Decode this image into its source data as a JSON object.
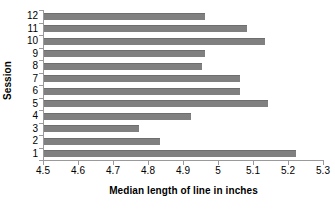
{
  "chart_data": {
    "type": "bar",
    "orientation": "horizontal",
    "title": "",
    "subtitle": "",
    "xlabel": "Median length of line in inches",
    "ylabel": "Session",
    "xlim": [
      4.5,
      5.3
    ],
    "xticks": [
      "4.5",
      "4.6",
      "4.7",
      "4.8",
      "4.9",
      "5",
      "5.1",
      "5.2",
      "5.3"
    ],
    "xtick_values": [
      4.5,
      4.6,
      4.7,
      4.8,
      4.9,
      5.0,
      5.1,
      5.2,
      5.3
    ],
    "grid": false,
    "legend": false,
    "legend_position": "none",
    "bar_color": "#808080",
    "bar_edge_color": "#6e6e6e",
    "axis_color": "#9a9a9a",
    "text_color": "#000000",
    "background_color": "#ffffff",
    "categories": [
      "12",
      "11",
      "10",
      "9",
      "8",
      "7",
      "6",
      "5",
      "4",
      "3",
      "2",
      "1"
    ],
    "values": [
      4.96,
      5.08,
      5.13,
      4.96,
      4.95,
      5.06,
      5.06,
      5.14,
      4.92,
      4.77,
      4.83,
      5.22
    ],
    "series": [
      {
        "name": "Median length of line in inches",
        "values": [
          4.96,
          5.08,
          5.13,
          4.96,
          4.95,
          5.06,
          5.06,
          5.14,
          4.92,
          4.77,
          4.83,
          5.22
        ]
      }
    ],
    "points": [
      {
        "session": "12",
        "value": 4.96
      },
      {
        "session": "11",
        "value": 5.08
      },
      {
        "session": "10",
        "value": 5.13
      },
      {
        "session": "9",
        "value": 4.96
      },
      {
        "session": "8",
        "value": 4.95
      },
      {
        "session": "7",
        "value": 5.06
      },
      {
        "session": "6",
        "value": 5.06
      },
      {
        "session": "5",
        "value": 5.14
      },
      {
        "session": "4",
        "value": 4.92
      },
      {
        "session": "3",
        "value": 4.77
      },
      {
        "session": "2",
        "value": 4.83
      },
      {
        "session": "1",
        "value": 5.22
      }
    ]
  }
}
